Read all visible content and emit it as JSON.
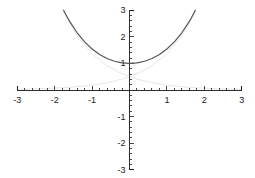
{
  "chart_data": {
    "type": "line",
    "title": "",
    "subtitle": "",
    "xlabel": "",
    "ylabel": "",
    "xlim": [
      -3,
      3
    ],
    "ylim": [
      -3,
      3
    ],
    "grid": false,
    "legend": "none",
    "x_ticks": [
      -3,
      -2,
      -1,
      1,
      2,
      3
    ],
    "y_ticks": [
      -3,
      -2,
      -1,
      1,
      2,
      3
    ],
    "x_tick_labels": [
      "-3",
      "-2",
      "-1",
      "1",
      "2",
      "3"
    ],
    "y_tick_labels": [
      "-3",
      "-2",
      "-1",
      "1",
      "2",
      "3"
    ],
    "minor_tick_step": 0.2,
    "axis_color": "#1a1a1a",
    "series": [
      {
        "name": "cosh(x)",
        "color": "#555555",
        "width": 1.2,
        "x": [
          -1.763,
          -1.6,
          -1.4,
          -1.2,
          -1.0,
          -0.8,
          -0.6,
          -0.4,
          -0.2,
          0.0,
          0.2,
          0.4,
          0.6,
          0.8,
          1.0,
          1.2,
          1.4,
          1.6,
          1.763
        ],
        "values": [
          3.0,
          2.577,
          2.151,
          1.811,
          1.543,
          1.337,
          1.185,
          1.081,
          1.02,
          1.0,
          1.02,
          1.081,
          1.185,
          1.337,
          1.543,
          1.811,
          2.151,
          2.577,
          3.0
        ]
      },
      {
        "name": "e^x/2",
        "color": "#e8e8e8",
        "width": 1.0,
        "x": [
          -3.0,
          -2.6,
          -2.2,
          -1.8,
          -1.4,
          -1.0,
          -0.6,
          -0.2,
          0.0,
          0.2,
          0.6,
          1.0,
          1.4,
          1.763
        ],
        "values": [
          0.025,
          0.037,
          0.055,
          0.083,
          0.123,
          0.184,
          0.274,
          0.409,
          0.5,
          0.611,
          0.911,
          1.359,
          2.028,
          2.915
        ]
      },
      {
        "name": "e^-x/2",
        "color": "#e8e8e8",
        "width": 1.0,
        "x": [
          -1.763,
          -1.4,
          -1.0,
          -0.6,
          -0.2,
          0.0,
          0.2,
          0.6,
          1.0,
          1.4,
          1.8,
          2.2,
          2.6,
          3.0
        ],
        "values": [
          2.915,
          2.028,
          1.359,
          0.911,
          0.611,
          0.5,
          0.409,
          0.274,
          0.184,
          0.123,
          0.083,
          0.055,
          0.037,
          0.025
        ]
      }
    ]
  }
}
